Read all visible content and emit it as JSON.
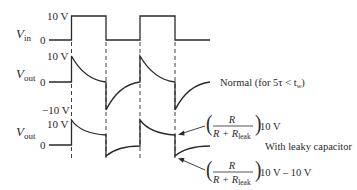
{
  "panels": {
    "vin": {
      "label_main": "V",
      "label_sub": "in",
      "tick_high": "10 V",
      "tick_zero": "0"
    },
    "vout_normal": {
      "label_main": "V",
      "label_sub": "out",
      "tick_high": "10 V",
      "tick_zero": "0",
      "tick_low": "−10 V",
      "annotation": "Normal (for 5τ < t",
      "annotation_sub": "w",
      "annotation_end": ")"
    },
    "vout_leaky": {
      "label_main": "V",
      "label_sub": "out",
      "tick_high": "10 V",
      "tick_zero": "0",
      "annotation": "With leaky capacitor",
      "formula_top": {
        "numerator": "R",
        "denominator_main": "R + R",
        "denominator_sub": "leak",
        "suffix": "10 V"
      },
      "formula_bottom": {
        "numerator": "R",
        "denominator_main": "R + R",
        "denominator_sub": "leak",
        "suffix": "10 V – 10 V"
      }
    }
  },
  "colors": {
    "ink": "#2a2a2a",
    "background": "#ffffff"
  }
}
